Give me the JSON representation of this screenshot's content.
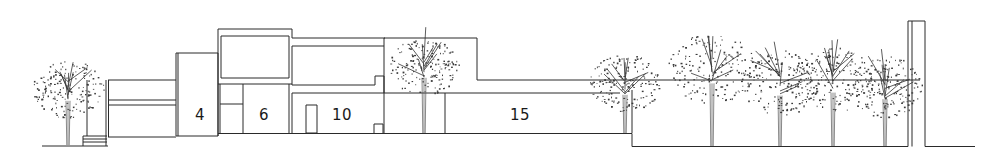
{
  "drawing": {
    "type": "architectural-section-elevation",
    "line_color": "#2a2a2a",
    "background": "#ffffff"
  },
  "room_labels": [
    {
      "id": "room-4",
      "text": "4",
      "x": 200,
      "y": 115
    },
    {
      "id": "room-6",
      "text": "6",
      "x": 264,
      "y": 115
    },
    {
      "id": "room-10",
      "text": "10",
      "x": 342,
      "y": 115
    },
    {
      "id": "room-15",
      "text": "15",
      "x": 520,
      "y": 115
    }
  ],
  "trees": [
    {
      "id": "tree-1",
      "cx": 68,
      "top": 60,
      "r": 34,
      "base": 145
    },
    {
      "id": "tree-2",
      "cx": 424,
      "top": 37,
      "r": 34,
      "base": 133
    },
    {
      "id": "tree-3",
      "cx": 625,
      "top": 54,
      "r": 34,
      "base": 133
    },
    {
      "id": "tree-4",
      "cx": 712,
      "top": 33,
      "r": 42,
      "base": 146
    },
    {
      "id": "tree-5",
      "cx": 780,
      "top": 50,
      "r": 38,
      "base": 146
    },
    {
      "id": "tree-6",
      "cx": 833,
      "top": 47,
      "r": 38,
      "base": 146
    },
    {
      "id": "tree-7",
      "cx": 885,
      "top": 56,
      "r": 36,
      "base": 146
    }
  ]
}
